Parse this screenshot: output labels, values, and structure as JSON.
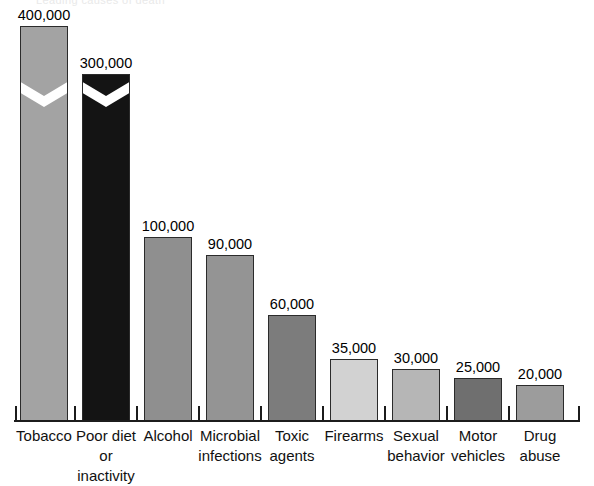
{
  "figure": {
    "top_fragment": "Leading causes of death",
    "axis_color": "#1c1c1c"
  },
  "chart_data": {
    "type": "bar",
    "title": "",
    "subtitle": "",
    "xlabel": "",
    "ylabel": "",
    "grid": false,
    "legend": null,
    "axis_note": "Vertical axis is unlabeled; the two tallest bars (Tobacco, Poor diet or inactivity) are drawn with a zig-zag scale break.",
    "categories": [
      "Tobacco",
      "Poor diet or inactivity",
      "Alcohol",
      "Microbial infections",
      "Toxic agents",
      "Firearms",
      "Sexual behavior",
      "Motor vehicles",
      "Drug abuse"
    ],
    "values": [
      400000,
      300000,
      100000,
      90000,
      60000,
      35000,
      30000,
      25000,
      20000
    ],
    "value_labels": [
      "400,000",
      "300,000",
      "100,000",
      "90,000",
      "60,000",
      "35,000",
      "30,000",
      "25,000",
      "20,000"
    ],
    "bar_colors": [
      "#a3a3a3",
      "#141414",
      "#8f8f8f",
      "#949494",
      "#7c7c7c",
      "#d2d2d2",
      "#b6b6b6",
      "#6f6f6f",
      "#9c9c9c"
    ],
    "has_scale_break": [
      true,
      true,
      false,
      false,
      false,
      false,
      false,
      false,
      false
    ],
    "ylim": [
      0,
      400000
    ]
  },
  "bars": [
    {
      "label_line1": "Tobacco",
      "label_line2": "",
      "value_label": "400,000",
      "color": "#a3a3a3",
      "x": 20,
      "width": 48,
      "top": 25,
      "break_top": 93
    },
    {
      "label_line1": "Poor diet",
      "label_line2": "or inactivity",
      "value_label": "300,000",
      "color": "#141414",
      "x": 82,
      "width": 48,
      "top": 73,
      "break_top": 93
    },
    {
      "label_line1": "Alcohol",
      "label_line2": "",
      "value_label": "100,000",
      "color": "#8f8f8f",
      "x": 144,
      "width": 48,
      "top": 236,
      "break_top": null
    },
    {
      "label_line1": "Microbial",
      "label_line2": "infections",
      "value_label": "90,000",
      "color": "#949494",
      "x": 206,
      "width": 48,
      "top": 254,
      "break_top": null
    },
    {
      "label_line1": "Toxic",
      "label_line2": "agents",
      "value_label": "60,000",
      "color": "#7c7c7c",
      "x": 268,
      "width": 48,
      "top": 314,
      "break_top": null
    },
    {
      "label_line1": "Firearms",
      "label_line2": "",
      "value_label": "35,000",
      "color": "#d2d2d2",
      "x": 330,
      "width": 48,
      "top": 358,
      "break_top": null
    },
    {
      "label_line1": "Sexual",
      "label_line2": "behavior",
      "value_label": "30,000",
      "color": "#b6b6b6",
      "x": 392,
      "width": 48,
      "top": 368,
      "break_top": null
    },
    {
      "label_line1": "Motor",
      "label_line2": "vehicles",
      "value_label": "25,000",
      "color": "#6f6f6f",
      "x": 454,
      "width": 48,
      "top": 377,
      "break_top": null
    },
    {
      "label_line1": "Drug",
      "label_line2": "abuse",
      "value_label": "20,000",
      "color": "#9c9c9c",
      "x": 516,
      "width": 48,
      "top": 384,
      "break_top": null
    }
  ],
  "ticks_x": [
    15,
    74,
    136,
    198,
    260,
    322,
    384,
    446,
    508,
    578
  ]
}
